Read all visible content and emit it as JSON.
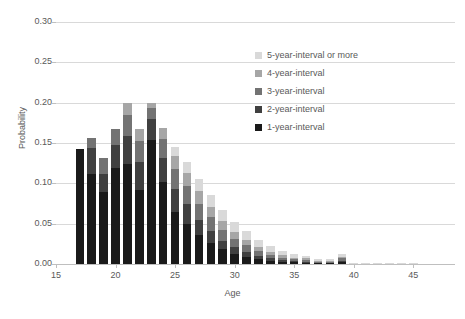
{
  "chart_data": {
    "type": "bar",
    "stacked": true,
    "title": "",
    "xlabel": "Age",
    "ylabel": "Probability",
    "xlim": [
      15,
      48.5
    ],
    "ylim": [
      0.0,
      0.3
    ],
    "x_ticks": [
      15,
      20,
      25,
      30,
      35,
      40,
      45
    ],
    "x_tick_labels": [
      "15",
      "20",
      "25",
      "30",
      "35",
      "40",
      "45"
    ],
    "y_ticks": [
      0.0,
      0.05,
      0.1,
      0.15,
      0.2,
      0.25,
      0.3
    ],
    "y_tick_labels": [
      "0.00",
      "0.05",
      "0.10",
      "0.15",
      "0.20",
      "0.25",
      "0.30"
    ],
    "grid": true,
    "grid_axis": "y",
    "legend_position": "inside-top-center",
    "categories": [
      17,
      18,
      19,
      20,
      21,
      22,
      23,
      24,
      25,
      26,
      27,
      28,
      29,
      30,
      31,
      32,
      33,
      34,
      35,
      36,
      37,
      38,
      39,
      40,
      41,
      42,
      43,
      44,
      45,
      46,
      47,
      48
    ],
    "series": [
      {
        "name": "1-year-interval",
        "color": "#1a1a1a",
        "values": [
          0.143,
          0.112,
          0.089,
          0.119,
          0.124,
          0.092,
          0.154,
          0.102,
          0.065,
          0.05,
          0.036,
          0.026,
          0.018,
          0.013,
          0.009,
          0.006,
          0.004,
          0.003,
          0.002,
          0.002,
          0.001,
          0.001,
          0.002,
          0.0,
          0.0,
          0.0,
          0.0,
          0.0,
          0.0,
          0.0,
          0.0,
          0.0
        ]
      },
      {
        "name": "2-year-interval",
        "color": "#404040",
        "values": [
          0.0,
          0.032,
          0.023,
          0.029,
          0.035,
          0.034,
          0.026,
          0.03,
          0.028,
          0.024,
          0.019,
          0.015,
          0.011,
          0.008,
          0.006,
          0.004,
          0.003,
          0.002,
          0.002,
          0.001,
          0.001,
          0.001,
          0.002,
          0.0,
          0.0,
          0.0,
          0.0,
          0.0,
          0.0,
          0.0,
          0.0,
          0.0
        ]
      },
      {
        "name": "3-year-interval",
        "color": "#737373",
        "values": [
          0.0,
          0.012,
          0.02,
          0.019,
          0.026,
          0.027,
          0.014,
          0.023,
          0.025,
          0.023,
          0.02,
          0.017,
          0.013,
          0.01,
          0.008,
          0.006,
          0.004,
          0.003,
          0.002,
          0.002,
          0.001,
          0.001,
          0.003,
          0.0,
          0.0,
          0.0,
          0.0,
          0.0,
          0.0,
          0.0,
          0.0,
          0.0
        ]
      },
      {
        "name": "4-year-interval",
        "color": "#a6a6a6",
        "values": [
          0.0,
          0.0,
          0.0,
          0.0,
          0.015,
          0.014,
          0.006,
          0.013,
          0.016,
          0.016,
          0.015,
          0.013,
          0.011,
          0.009,
          0.007,
          0.005,
          0.004,
          0.003,
          0.002,
          0.002,
          0.001,
          0.001,
          0.002,
          0.0,
          0.0,
          0.0,
          0.0,
          0.0,
          0.0,
          0.0,
          0.0,
          0.0
        ]
      },
      {
        "name": "5-year-interval or more",
        "color": "#d9d9d9",
        "values": [
          0.0,
          0.0,
          0.0,
          0.0,
          0.0,
          0.0,
          0.0,
          0.0,
          0.011,
          0.014,
          0.015,
          0.015,
          0.014,
          0.012,
          0.011,
          0.009,
          0.007,
          0.005,
          0.004,
          0.003,
          0.002,
          0.002,
          0.004,
          0.001,
          0.001,
          0.001,
          0.001,
          0.001,
          0.001,
          0.0,
          0.0,
          0.0
        ]
      }
    ],
    "legend": [
      {
        "label": "5-year-interval or more",
        "color": "#d9d9d9"
      },
      {
        "label": "4-year-interval",
        "color": "#a6a6a6"
      },
      {
        "label": "3-year-interval",
        "color": "#737373"
      },
      {
        "label": "2-year-interval",
        "color": "#404040"
      },
      {
        "label": "1-year-interval",
        "color": "#1a1a1a"
      }
    ]
  }
}
